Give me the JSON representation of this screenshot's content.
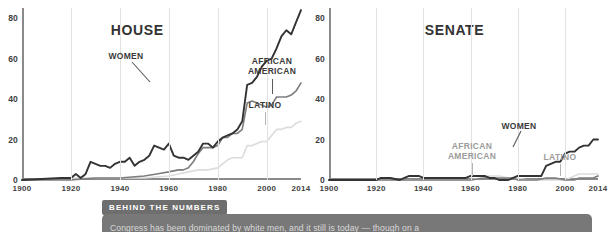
{
  "chart_data": [
    {
      "type": "line",
      "title": "HOUSE",
      "xlabel": "",
      "ylabel": "",
      "xlim": [
        1900,
        2014
      ],
      "ylim": [
        0,
        85
      ],
      "grid": true,
      "legend_position": "inline-annotations",
      "xticks": [
        "1900",
        "1920",
        "1940",
        "1960",
        "1980",
        "2000",
        "2014"
      ],
      "yticks": [
        "0",
        "20",
        "40",
        "60",
        "80"
      ],
      "annotations": [
        {
          "label": "WOMEN",
          "color": "#3a3a3a"
        },
        {
          "label": "AFRICAN\nAMERICAN",
          "color": "#3a3a3a"
        },
        {
          "label": "LATINO",
          "color": "#9b9b9b"
        }
      ],
      "series": [
        {
          "name": "WOMEN",
          "color": "#333333",
          "x": [
            1900,
            1916,
            1920,
            1922,
            1924,
            1926,
            1928,
            1930,
            1932,
            1934,
            1936,
            1938,
            1940,
            1942,
            1944,
            1946,
            1948,
            1950,
            1952,
            1954,
            1956,
            1958,
            1960,
            1962,
            1964,
            1966,
            1968,
            1970,
            1972,
            1974,
            1976,
            1978,
            1980,
            1982,
            1984,
            1986,
            1988,
            1990,
            1992,
            1994,
            1996,
            1998,
            2000,
            2002,
            2004,
            2006,
            2008,
            2010,
            2012,
            2014
          ],
          "values": [
            0,
            1,
            1,
            3,
            1,
            3,
            9,
            8,
            7,
            7,
            6,
            8,
            9,
            9,
            11,
            7,
            9,
            10,
            12,
            17,
            16,
            15,
            18,
            12,
            11,
            11,
            10,
            12,
            14,
            18,
            18,
            16,
            19,
            21,
            22,
            23,
            25,
            29,
            47,
            48,
            51,
            56,
            59,
            60,
            65,
            71,
            74,
            72,
            78,
            84
          ]
        },
        {
          "name": "AFRICAN AMERICAN",
          "color": "#7d7d7d",
          "x": [
            1900,
            1920,
            1930,
            1940,
            1950,
            1955,
            1960,
            1964,
            1966,
            1968,
            1970,
            1972,
            1974,
            1976,
            1978,
            1980,
            1982,
            1984,
            1986,
            1988,
            1990,
            1992,
            1994,
            1996,
            1998,
            2000,
            2002,
            2004,
            2006,
            2008,
            2010,
            2012,
            2014
          ],
          "values": [
            0,
            0,
            1,
            1,
            2,
            3,
            4,
            5,
            5,
            6,
            9,
            13,
            16,
            16,
            16,
            17,
            21,
            21,
            23,
            23,
            25,
            38,
            39,
            38,
            37,
            36,
            37,
            41,
            41,
            41,
            42,
            44,
            48
          ]
        },
        {
          "name": "LATINO",
          "color": "#dcdcdc",
          "x": [
            1900,
            1920,
            1930,
            1940,
            1950,
            1960,
            1964,
            1968,
            1972,
            1976,
            1980,
            1982,
            1984,
            1986,
            1988,
            1990,
            1992,
            1994,
            1996,
            1998,
            2000,
            2002,
            2004,
            2006,
            2008,
            2010,
            2012,
            2014
          ],
          "values": [
            0,
            1,
            1,
            1,
            1,
            2,
            3,
            4,
            5,
            5,
            6,
            8,
            10,
            11,
            11,
            11,
            17,
            17,
            18,
            19,
            19,
            22,
            25,
            25,
            26,
            26,
            28,
            29
          ]
        }
      ]
    },
    {
      "type": "line",
      "title": "SENATE",
      "xlabel": "",
      "ylabel": "",
      "xlim": [
        1900,
        2014
      ],
      "ylim": [
        0,
        85
      ],
      "grid": true,
      "legend_position": "inline-annotations",
      "xticks": [
        "1900",
        "1920",
        "1940",
        "1960",
        "1980",
        "2000",
        "2014"
      ],
      "yticks": [
        "0",
        "20",
        "40",
        "60",
        "80"
      ],
      "annotations": [
        {
          "label": "WOMEN",
          "color": "#3a3a3a"
        },
        {
          "label": "AFRICAN\nAMERICAN",
          "color": "#9b9b9b"
        },
        {
          "label": "LATINO",
          "color": "#9b9b9b"
        }
      ],
      "series": [
        {
          "name": "WOMEN",
          "color": "#333333",
          "x": [
            1900,
            1918,
            1920,
            1922,
            1926,
            1930,
            1932,
            1934,
            1936,
            1938,
            1940,
            1942,
            1944,
            1946,
            1948,
            1950,
            1952,
            1954,
            1956,
            1958,
            1960,
            1962,
            1964,
            1966,
            1968,
            1970,
            1972,
            1974,
            1976,
            1978,
            1980,
            1982,
            1984,
            1986,
            1988,
            1990,
            1992,
            1994,
            1996,
            1998,
            2000,
            2002,
            2004,
            2006,
            2008,
            2010,
            2012,
            2014
          ],
          "values": [
            0,
            0,
            0,
            1,
            1,
            0,
            1,
            2,
            2,
            2,
            1,
            1,
            1,
            1,
            1,
            1,
            1,
            1,
            1,
            1,
            2,
            2,
            2,
            2,
            1,
            1,
            0,
            0,
            0,
            1,
            2,
            2,
            2,
            2,
            2,
            2,
            7,
            8,
            9,
            9,
            13,
            14,
            14,
            16,
            17,
            17,
            20,
            20
          ]
        },
        {
          "name": "AFRICAN AMERICAN",
          "color": "#7d7d7d",
          "x": [
            1900,
            1920,
            1940,
            1955,
            1960,
            1966,
            1968,
            1972,
            1976,
            1978,
            1980,
            1984,
            1988,
            1992,
            1994,
            1996,
            2000,
            2004,
            2006,
            2008,
            2010,
            2012,
            2014
          ],
          "values": [
            0,
            0,
            0,
            0,
            0,
            1,
            1,
            1,
            1,
            1,
            0,
            0,
            0,
            1,
            1,
            1,
            0,
            0,
            1,
            1,
            1,
            1,
            2
          ]
        },
        {
          "name": "LATINO",
          "color": "#dcdcdc",
          "x": [
            1900,
            1920,
            1940,
            1960,
            1964,
            1968,
            1972,
            1976,
            1980,
            1984,
            1988,
            1992,
            1996,
            2000,
            2004,
            2006,
            2008,
            2010,
            2012,
            2014
          ],
          "values": [
            0,
            0,
            0,
            0,
            1,
            2,
            2,
            1,
            1,
            0,
            0,
            0,
            0,
            0,
            2,
            3,
            3,
            3,
            3,
            3
          ]
        }
      ]
    }
  ],
  "house": {
    "title": "HOUSE",
    "yticks": [
      "80",
      "60",
      "40",
      "20",
      "0"
    ],
    "xticks": [
      "1900",
      "1920",
      "1940",
      "1960",
      "1980",
      "2000",
      "2014"
    ],
    "ann_women": "WOMEN",
    "ann_african_american": "AFRICAN\nAMERICAN",
    "ann_latino": "LATINO"
  },
  "senate": {
    "title": "SENATE",
    "yticks": [
      "80",
      "60",
      "40",
      "20",
      "0"
    ],
    "xticks": [
      "1900",
      "1920",
      "1940",
      "1960",
      "1980",
      "2000",
      "2014"
    ],
    "ann_women": "WOMEN",
    "ann_african_american": "AFRICAN\nAMERICAN",
    "ann_latino": "LATINO"
  },
  "banner": {
    "tab_label": "BEHIND THE NUMBERS",
    "body_text": "Congress has been dominated by white men, and it still is today — though on a"
  },
  "colors": {
    "women": "#333333",
    "african_american": "#7d7d7d",
    "latino": "#dcdcdc",
    "axis": "#8a8a8a",
    "grid": "#e2e2e2",
    "banner": "#787878"
  }
}
